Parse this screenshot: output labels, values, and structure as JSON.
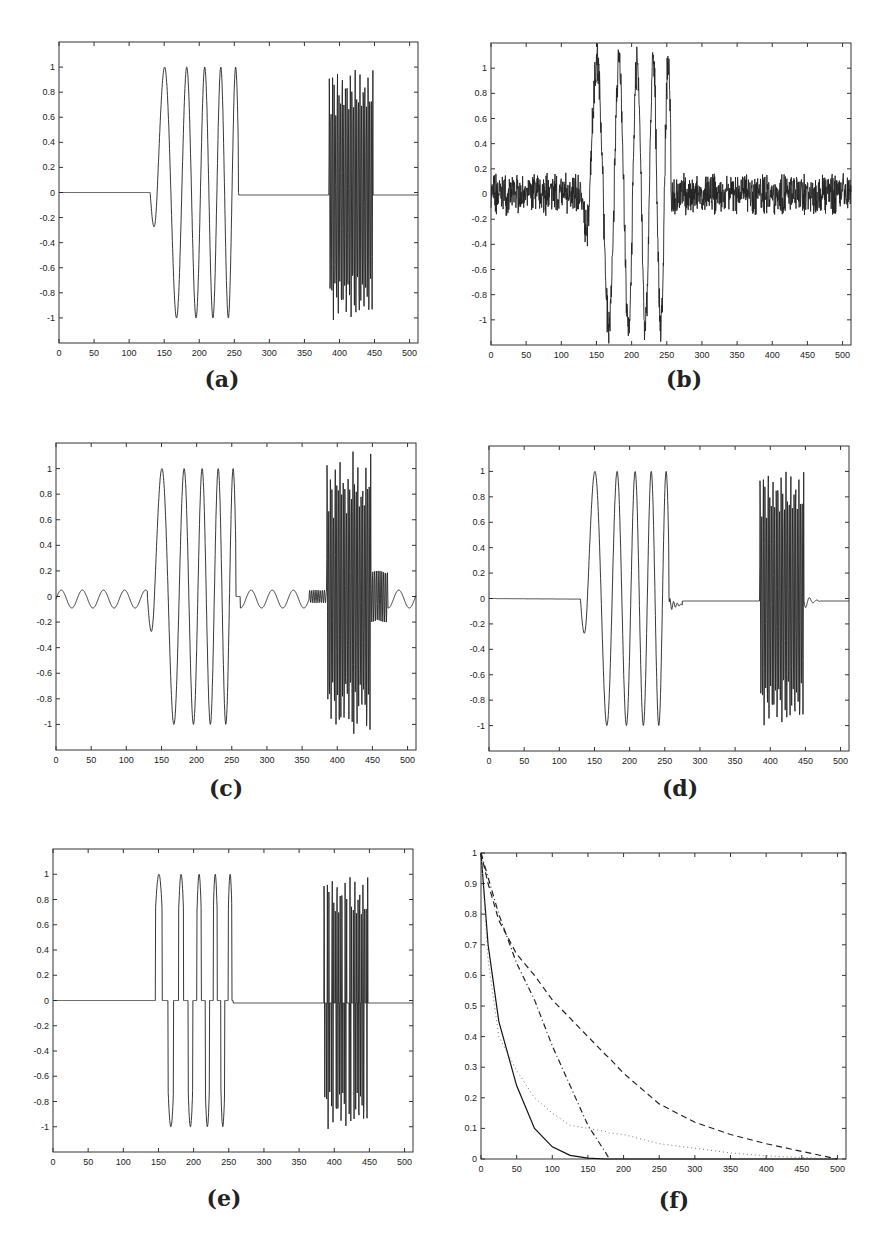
{
  "figure": {
    "captions": [
      "(a)",
      "(b)",
      "(c)",
      "(d)",
      "(e)",
      "(f)"
    ]
  },
  "chart_data": [
    {
      "id": "a",
      "type": "line",
      "title": "",
      "caption": "(a)",
      "xlabel": "",
      "ylabel": "",
      "xlim": [
        0,
        512
      ],
      "ylim": [
        -1.2,
        1.2
      ],
      "xticks": [
        0,
        50,
        100,
        150,
        200,
        250,
        300,
        350,
        400,
        450,
        500
      ],
      "yticks": [
        -1,
        -0.8,
        -0.6,
        -0.4,
        -0.2,
        0,
        0.2,
        0.4,
        0.6,
        0.8,
        1
      ],
      "ytick_labels": [
        "-1",
        "-0.8",
        "-0.6",
        "-0.4",
        "-0.2",
        "0",
        "0.2",
        "0.4",
        "0.6",
        "0.8",
        "1"
      ],
      "grid": false,
      "series": [
        {
          "name": "original signal",
          "style": "solid",
          "description": "zero until ~130, chirp 130-256 with peaks at 155,190,213,234,250 (amplitude 1), zero 256-385, high-frequency burst 385-448 (amplitude ~1), zero after",
          "segments": [
            {
              "kind": "zero",
              "x": [
                0,
                130
              ]
            },
            {
              "kind": "chirp",
              "x": [
                130,
                256
              ],
              "amplitude": 1.0,
              "peaks_x": [
                155,
                190,
                213,
                234,
                250
              ],
              "troughs_x": [
                172,
                200,
                222,
                240
              ]
            },
            {
              "kind": "zero",
              "x": [
                256,
                385
              ]
            },
            {
              "kind": "burst",
              "x": [
                385,
                448
              ],
              "amplitude": 1.0
            },
            {
              "kind": "zero",
              "x": [
                448,
                512
              ]
            }
          ]
        }
      ]
    },
    {
      "id": "b",
      "type": "line",
      "caption": "(b)",
      "xlim": [
        0,
        512
      ],
      "ylim": [
        -1.2,
        1.2
      ],
      "xticks": [
        0,
        50,
        100,
        150,
        200,
        250,
        300,
        350,
        400,
        450,
        500
      ],
      "yticks": [
        -1,
        -0.8,
        -0.6,
        -0.4,
        -0.2,
        0,
        0.2,
        0.4,
        0.6,
        0.8,
        1
      ],
      "ytick_labels": [
        "-1",
        "-0.8",
        "-0.6",
        "-0.4",
        "-0.2",
        "0",
        "0.2",
        "0.4",
        "0.6",
        "0.8",
        "1"
      ],
      "grid": false,
      "series": [
        {
          "name": "reconstruction b",
          "style": "solid",
          "description": "noisy baseline (±0.2) everywhere, chirp 130-270 peaks 1.03,0.97,1.13,0.92,0.68 troughs -1.1,-1.08,-1.14,-0.95, no high-frequency burst",
          "peaks": [
            1.03,
            0.97,
            1.13,
            0.92,
            0.68
          ],
          "troughs": [
            -1.1,
            -1.08,
            -1.14,
            -0.95
          ],
          "noise_amplitude": 0.2
        }
      ]
    },
    {
      "id": "c",
      "type": "line",
      "caption": "(c)",
      "xlim": [
        0,
        512
      ],
      "ylim": [
        -1.2,
        1.2
      ],
      "xticks": [
        0,
        50,
        100,
        150,
        200,
        250,
        300,
        350,
        400,
        450,
        500
      ],
      "yticks": [
        -1,
        -0.8,
        -0.6,
        -0.4,
        -0.2,
        0,
        0.2,
        0.4,
        0.6,
        0.8,
        1
      ],
      "ytick_labels": [
        "-1",
        "-0.8",
        "-0.6",
        "-0.4",
        "-0.2",
        "0",
        "0.2",
        "0.4",
        "0.6",
        "0.8",
        "1"
      ],
      "grid": false,
      "series": [
        {
          "name": "reconstruction c",
          "style": "solid",
          "description": "smooth ripples (±0.1) on baseline, chirp peaks 0.95,0.94,0.9,1.02,1.02 troughs -1.03,-1.03,-0.95,-0.97, burst 385-470 amplitude up to 1.1",
          "peaks": [
            0.95,
            0.94,
            0.9,
            1.02,
            1.02
          ],
          "troughs": [
            -1.03,
            -1.03,
            -0.95,
            -0.97
          ],
          "ripple_amplitude": 0.1,
          "burst_amplitude": 1.1
        }
      ]
    },
    {
      "id": "d",
      "type": "line",
      "caption": "(d)",
      "xlim": [
        0,
        512
      ],
      "ylim": [
        -1.2,
        1.2
      ],
      "xticks": [
        0,
        50,
        100,
        150,
        200,
        250,
        300,
        350,
        400,
        450,
        500
      ],
      "yticks": [
        -1,
        -0.8,
        -0.6,
        -0.4,
        -0.2,
        0,
        0.2,
        0.4,
        0.6,
        0.8,
        1
      ],
      "ytick_labels": [
        "-1",
        "-0.8",
        "-0.6",
        "-0.4",
        "-0.2",
        "0",
        "0.2",
        "0.4",
        "0.6",
        "0.8",
        "1"
      ],
      "grid": false,
      "series": [
        {
          "name": "reconstruction d",
          "style": "solid",
          "description": "near-exact reconstruction with small ringing after 256 and 448; chirp peaks 1.05,1.0,1.05,1.07,0.95 troughs -1.0,-1.08,-0.96,-1.03; burst amplitude ~1",
          "peaks": [
            1.05,
            1.0,
            1.05,
            1.07,
            0.95
          ],
          "troughs": [
            -1.0,
            -1.08,
            -0.96,
            -1.03
          ],
          "burst_amplitude": 1.0
        }
      ]
    },
    {
      "id": "e",
      "type": "line",
      "caption": "(e)",
      "xlim": [
        0,
        512
      ],
      "ylim": [
        -1.2,
        1.2
      ],
      "xticks": [
        0,
        50,
        100,
        150,
        200,
        250,
        300,
        350,
        400,
        450,
        500
      ],
      "yticks": [
        -1,
        -0.8,
        -0.6,
        -0.4,
        -0.2,
        0,
        0.2,
        0.4,
        0.6,
        0.8,
        1
      ],
      "ytick_labels": [
        "-1",
        "-0.8",
        "-0.6",
        "-0.4",
        "-0.2",
        "0",
        "0.2",
        "0.4",
        "0.6",
        "0.8",
        "1"
      ],
      "grid": false,
      "series": [
        {
          "name": "thresholded signal",
          "style": "solid",
          "description": "chirp and burst with values near zero crossings clipped to 0 (hard threshold ~0.7); peaks ~0.99, troughs ~-1.0",
          "threshold": 0.7
        }
      ]
    },
    {
      "id": "f",
      "type": "line",
      "caption": "(f)",
      "xlim": [
        0,
        512
      ],
      "ylim": [
        0,
        1
      ],
      "xticks": [
        0,
        50,
        100,
        150,
        200,
        250,
        300,
        350,
        400,
        450,
        500
      ],
      "yticks": [
        0,
        0.1,
        0.2,
        0.3,
        0.4,
        0.5,
        0.6,
        0.7,
        0.8,
        0.9,
        1
      ],
      "ytick_labels": [
        "0",
        "0.1",
        "0.2",
        "0.3",
        "0.4",
        "0.5",
        "0.6",
        "0.7",
        "0.8",
        "0.9",
        "1"
      ],
      "grid": false,
      "x": [
        0,
        10,
        25,
        50,
        75,
        100,
        125,
        150,
        175,
        180,
        200,
        250,
        300,
        350,
        400,
        450,
        500
      ],
      "series": [
        {
          "name": "solid",
          "style": "solid",
          "values": [
            1.0,
            0.7,
            0.45,
            0.24,
            0.1,
            0.04,
            0.012,
            0.003,
            0.0,
            0.0,
            0.0,
            0.0,
            0.0,
            0.0,
            0.0,
            0.0,
            0.0
          ]
        },
        {
          "name": "dotted",
          "style": "dotted",
          "values": [
            1.0,
            0.65,
            0.4,
            0.29,
            0.2,
            0.15,
            0.11,
            0.1,
            0.09,
            0.085,
            0.08,
            0.05,
            0.035,
            0.02,
            0.01,
            0.005,
            0.0
          ]
        },
        {
          "name": "dash-dot",
          "style": "dashdot",
          "values": [
            1.0,
            0.92,
            0.8,
            0.64,
            0.52,
            0.37,
            0.24,
            0.11,
            0.02,
            0.0,
            null,
            null,
            null,
            null,
            null,
            null,
            null
          ]
        },
        {
          "name": "dashed",
          "style": "dashed",
          "values": [
            1.0,
            0.9,
            0.78,
            0.67,
            0.6,
            0.52,
            0.46,
            0.4,
            0.34,
            0.33,
            0.28,
            0.18,
            0.12,
            0.08,
            0.05,
            0.025,
            0.0
          ]
        }
      ]
    }
  ]
}
